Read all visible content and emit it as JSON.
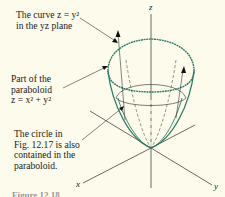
{
  "figure": {
    "annotations": {
      "curve": {
        "lines": [
          "The curve z = y²",
          "in the yz plane"
        ]
      },
      "paraboloid": {
        "lines": [
          "Part of the",
          "paraboloid",
          "z = x² + y²"
        ]
      },
      "circle": {
        "lines": [
          "The circle in",
          "Fig. 12.17 is also",
          "contained in the",
          "paraboloid."
        ]
      }
    },
    "axes": {
      "x": "x",
      "y": "y",
      "z": "z"
    },
    "caption_partial": "Figure 12.18"
  },
  "colors": {
    "surface": "#2e7a6a",
    "axes": "#444444",
    "background": "#fdfcec"
  }
}
